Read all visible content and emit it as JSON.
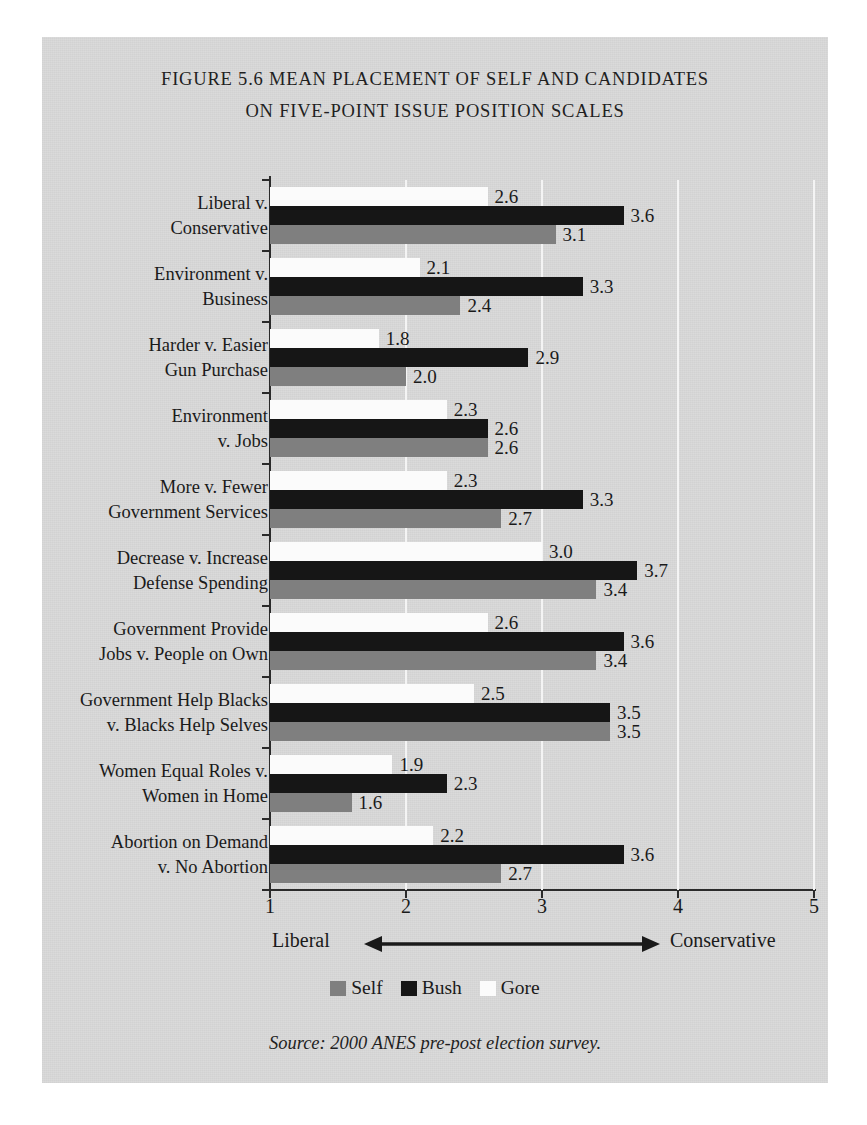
{
  "figure": {
    "title_line1": "FIGURE 5.6 MEAN PLACEMENT OF SELF AND CANDIDATES",
    "title_line2": "ON FIVE-POINT ISSUE POSITION SCALES",
    "source": "Source: 2000 ANES pre-post election survey."
  },
  "axis": {
    "left_anchor_label": "Liberal",
    "right_anchor_label": "Conservative",
    "tick_labels": [
      "1",
      "2",
      "3",
      "4",
      "5"
    ]
  },
  "legend": {
    "items": [
      {
        "label": "Self",
        "color": "#7f7f7f"
      },
      {
        "label": "Bush",
        "color": "#161616"
      },
      {
        "label": "Gore",
        "color": "#fbfbfb"
      }
    ]
  },
  "colors": {
    "panel_background": "#d9d9d9",
    "page_background": "#ffffff",
    "axis": "#2b2b2b",
    "gridline": "#f4f4f4",
    "self": "#7f7f7f",
    "bush": "#161616",
    "gore": "#fbfbfb",
    "text": "#1a1a1a"
  },
  "chart_data": {
    "type": "bar",
    "orientation": "horizontal",
    "title": "FIGURE 5.6 MEAN PLACEMENT OF SELF AND CANDIDATES ON FIVE-POINT ISSUE POSITION SCALES",
    "xlabel": "",
    "ylabel": "",
    "xlim": [
      1,
      5
    ],
    "xticks": [
      1,
      2,
      3,
      4,
      5
    ],
    "grid": "vertical",
    "legend_position": "bottom",
    "axis_anchors": {
      "left": "Liberal",
      "right": "Conservative"
    },
    "source": "Source: 2000 ANES pre-post election survey.",
    "categories": [
      "Liberal v. Conservative",
      "Environment v. Business",
      "Harder v. Easier Gun Purchase",
      "Environment v. Jobs",
      "More v. Fewer Government Services",
      "Decrease v. Increase Defense Spending",
      "Government Provide Jobs v. People on Own",
      "Government Help Blacks v. Blacks Help Selves",
      "Women Equal Roles v. Women in Home",
      "Abortion on Demand v. No Abortion"
    ],
    "category_lines": [
      [
        "Liberal v.",
        "Conservative"
      ],
      [
        "Environment v.",
        "Business"
      ],
      [
        "Harder v. Easier",
        "Gun Purchase"
      ],
      [
        "Environment",
        "v. Jobs"
      ],
      [
        "More v. Fewer",
        "Government Services"
      ],
      [
        "Decrease v. Increase",
        "Defense Spending"
      ],
      [
        "Government Provide",
        "Jobs v. People on Own"
      ],
      [
        "Government Help Blacks",
        "v. Blacks Help Selves"
      ],
      [
        "Women Equal Roles v.",
        "Women in Home"
      ],
      [
        "Abortion on Demand",
        "v. No Abortion"
      ]
    ],
    "series": [
      {
        "name": "Gore",
        "color": "#fbfbfb",
        "values": [
          2.6,
          2.1,
          1.8,
          2.3,
          2.3,
          3.0,
          2.6,
          2.5,
          1.9,
          2.2
        ],
        "labels": [
          "2.6",
          "2.1",
          "1.8",
          "2.3",
          "2.3",
          "3.0",
          "2.6",
          "2.5",
          "1.9",
          "2.2"
        ]
      },
      {
        "name": "Bush",
        "color": "#161616",
        "values": [
          3.6,
          3.3,
          2.9,
          2.6,
          3.3,
          3.7,
          3.6,
          3.5,
          2.3,
          3.6
        ],
        "labels": [
          "3.6",
          "3.3",
          "2.9",
          "2.6",
          "3.3",
          "3.7",
          "3.6",
          "3.5",
          "2.3",
          "3.6"
        ]
      },
      {
        "name": "Self",
        "color": "#7f7f7f",
        "values": [
          3.1,
          2.4,
          2.0,
          2.6,
          2.7,
          3.4,
          3.4,
          3.5,
          1.6,
          2.7
        ],
        "labels": [
          "3.1",
          "2.4",
          "2.0",
          "2.6",
          "2.7",
          "3.4",
          "3.4",
          "3.5",
          "1.6",
          "2.7"
        ]
      }
    ]
  }
}
